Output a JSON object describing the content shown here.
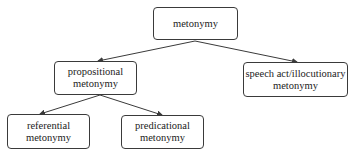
{
  "diagram": {
    "type": "tree",
    "nodes": {
      "root": {
        "line1": "metonymy",
        "line2": ""
      },
      "propositional": {
        "line1": "propositional",
        "line2": "metonymy"
      },
      "speech_act": {
        "line1": "speech act/illocutionary",
        "line2": "metonymy"
      },
      "referential": {
        "line1": "referential",
        "line2": "metonymy"
      },
      "predicational": {
        "line1": "predicational",
        "line2": "metonymy"
      }
    },
    "edges": [
      {
        "from": "metonymy",
        "to": "propositional metonymy"
      },
      {
        "from": "metonymy",
        "to": "speech act/illocutionary metonymy"
      },
      {
        "from": "propositional metonymy",
        "to": "referential metonymy"
      },
      {
        "from": "propositional metonymy",
        "to": "predicational metonymy"
      }
    ],
    "colors": {
      "stroke": "#3a3a3a",
      "text": "#222222",
      "background": "#ffffff"
    }
  }
}
